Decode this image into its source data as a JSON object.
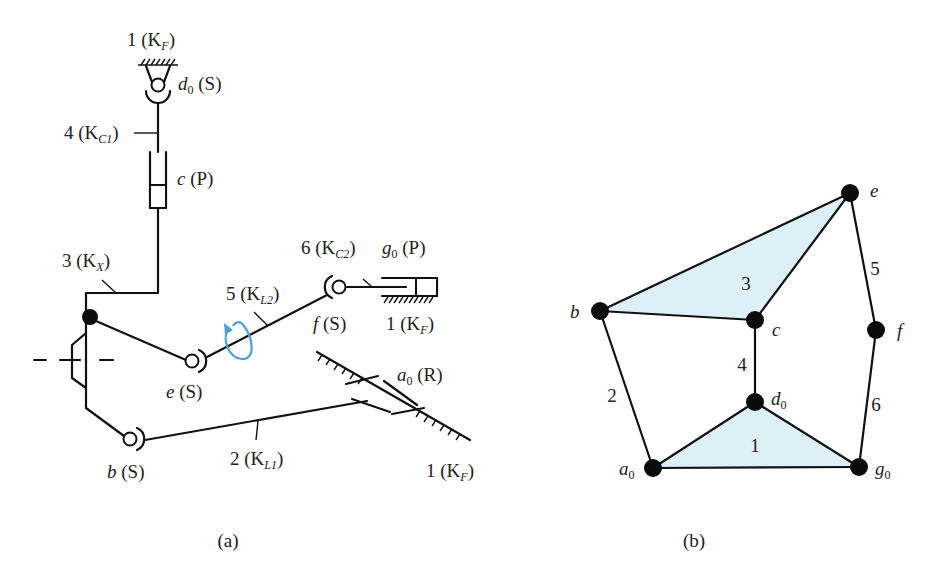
{
  "figure": {
    "panel_a": {
      "caption": "(a)",
      "labels": {
        "top_ground": "1 (K",
        "top_ground_sub": "F",
        "top_ground_end": ")",
        "d0": "d",
        "d0_sub": "0",
        "d0_type": " (S)",
        "link4": "4 (K",
        "link4_sub": "C1",
        "link4_end": ")",
        "c": "c",
        "c_type": " (P)",
        "link3": "3 (K",
        "link3_sub": "X",
        "link3_end": ")",
        "link6": "6 (K",
        "link6_sub": "C2",
        "link6_end": ")",
        "g0": "g",
        "g0_sub": "0",
        "g0_type": " (P)",
        "link5": "5 (K",
        "link5_sub": "L2",
        "link5_end": ")",
        "f": "f",
        "f_type": " (S)",
        "ground_f": "1 (K",
        "ground_f_sub": "F",
        "ground_f_end": ")",
        "e": "e",
        "e_type": " (S)",
        "a0": "a",
        "a0_sub": "0",
        "a0_type": " (R)",
        "b": "b",
        "b_type": " (S)",
        "link2": "2 (K",
        "link2_sub": "L1",
        "link2_end": ")",
        "ground_a0": "1 (K",
        "ground_a0_sub": "F",
        "ground_a0_end": ")"
      },
      "rotation_arrow_color": "#4a9fd6"
    },
    "panel_b": {
      "caption": "(b)",
      "fill_color": "#ddf0f7",
      "nodes": [
        {
          "id": "e",
          "label": "e",
          "sub": "",
          "x": 850,
          "y": 193
        },
        {
          "id": "b",
          "label": "b",
          "sub": "",
          "x": 600,
          "y": 311
        },
        {
          "id": "c",
          "label": "c",
          "sub": "",
          "x": 755,
          "y": 320
        },
        {
          "id": "f",
          "label": "f",
          "sub": "",
          "x": 876,
          "y": 330
        },
        {
          "id": "d0",
          "label": "d",
          "sub": "0",
          "x": 755,
          "y": 402
        },
        {
          "id": "a0",
          "label": "a",
          "sub": "0",
          "x": 653,
          "y": 468
        },
        {
          "id": "g0",
          "label": "g",
          "sub": "0",
          "x": 859,
          "y": 467
        }
      ],
      "edges": [
        {
          "from": "b",
          "to": "e"
        },
        {
          "from": "e",
          "to": "c"
        },
        {
          "from": "b",
          "to": "c"
        },
        {
          "from": "e",
          "to": "f"
        },
        {
          "from": "f",
          "to": "g0"
        },
        {
          "from": "c",
          "to": "d0"
        },
        {
          "from": "b",
          "to": "a0"
        },
        {
          "from": "a0",
          "to": "d0"
        },
        {
          "from": "d0",
          "to": "g0"
        },
        {
          "from": "a0",
          "to": "g0"
        }
      ],
      "link_labels": [
        {
          "text": "3",
          "x": 746,
          "y": 290
        },
        {
          "text": "5",
          "x": 875,
          "y": 275
        },
        {
          "text": "4",
          "x": 742,
          "y": 371
        },
        {
          "text": "2",
          "x": 612,
          "y": 402
        },
        {
          "text": "6",
          "x": 876,
          "y": 411
        },
        {
          "text": "1",
          "x": 755,
          "y": 452
        }
      ]
    }
  }
}
